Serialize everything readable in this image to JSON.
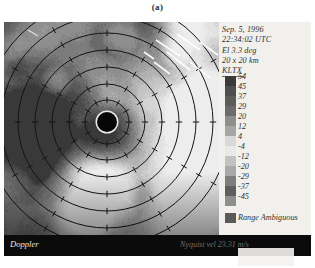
{
  "caption": "(a)",
  "figure": {
    "type": "doppler-radar-velocity-display",
    "header": {
      "date": "Sep. 5, 1996",
      "time": "22:34:02 UTC",
      "elevation": "El 3.3 deg",
      "domain_size": "20 x  20 km",
      "site": "KLTX"
    },
    "colorbar": {
      "labels": [
        "54",
        "45",
        "37",
        "29",
        "20",
        "12",
        "4",
        "-4",
        "-12",
        "-20",
        "-29",
        "-37",
        "-45"
      ],
      "colors": [
        "#3a3a3a",
        "#4e4e4e",
        "#5c5c5c",
        "#6b6b6b",
        "#8e8e8e",
        "#a6a6a6",
        "#d8d8d8",
        "#e9e9e9",
        "#c2c2c2",
        "#a8a8a8",
        "#7d7d7d",
        "#5e5e5e",
        "#8f8f8f"
      ],
      "range_ambiguous_label": "Range Ambiguous",
      "range_ambiguous_color": "#5a5a5a",
      "units": "m/s"
    },
    "status": {
      "product": "Doppler",
      "nyquist": "Nyquist vel 23.31 m/s"
    },
    "radar": {
      "center_x": 103,
      "center_y": 100,
      "site_disk_radius": 10,
      "ring_radii": [
        22,
        38,
        55,
        72,
        89,
        106,
        123
      ],
      "ring_color": "#141414",
      "background": "#8a8a8a"
    }
  },
  "chart_data": {
    "type": "heatmap",
    "subtitle": "Sep. 5, 1996  22:34:02 UTC  El 3.3 deg",
    "xlabel": "20 km",
    "ylabel": "20 km",
    "legend_position": "right",
    "grid": true,
    "colorbar_values": [
      54,
      45,
      37,
      29,
      20,
      12,
      4,
      -4,
      -12,
      -20,
      -29,
      -37,
      -45
    ],
    "colorbar_units": "m/s",
    "nyquist_velocity": 23.31,
    "elevation_deg": 3.3,
    "domain_km": [
      20,
      20
    ],
    "range_ring_spacing_km": 2.5
  }
}
